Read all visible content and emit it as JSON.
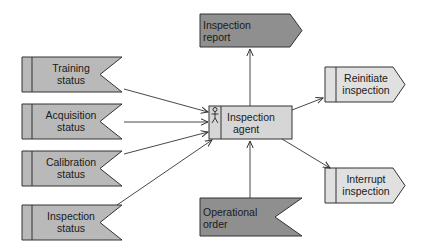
{
  "diagram": {
    "type": "event-driven process diagram",
    "colors": {
      "input_fill": "#b9b9b9",
      "output_dark_fill": "#8f8f8f",
      "output_light_fill": "#e0e0e0",
      "agent_fill": "#d6d6d6",
      "stroke": "#333333"
    },
    "inputs": [
      {
        "id": "training",
        "line1": "Training",
        "line2": "status"
      },
      {
        "id": "acquisition",
        "line1": "Acquisition",
        "line2": "status"
      },
      {
        "id": "calibration",
        "line1": "Calibration",
        "line2": "status"
      },
      {
        "id": "inspection_status",
        "line1": "Inspection",
        "line2": "status"
      }
    ],
    "agent": {
      "line1": "Inspection",
      "line2": "agent",
      "icon": "person-icon"
    },
    "report": {
      "line1": "Inspection",
      "line2": "report"
    },
    "order": {
      "line1": "Operational",
      "line2": "order"
    },
    "outputs": [
      {
        "id": "reinitiate",
        "line1": "Reinitiate",
        "line2": "inspection"
      },
      {
        "id": "interrupt",
        "line1": "Interrupt",
        "line2": "inspection"
      }
    ],
    "edges": [
      {
        "from": "Training status",
        "to": "Inspection agent"
      },
      {
        "from": "Acquisition status",
        "to": "Inspection agent"
      },
      {
        "from": "Calibration status",
        "to": "Inspection agent"
      },
      {
        "from": "Inspection status",
        "to": "Inspection agent"
      },
      {
        "from": "Operational order",
        "to": "Inspection agent"
      },
      {
        "from": "Inspection agent",
        "to": "Inspection report"
      },
      {
        "from": "Inspection agent",
        "to": "Reinitiate inspection"
      },
      {
        "from": "Inspection agent",
        "to": "Interrupt inspection"
      }
    ]
  }
}
